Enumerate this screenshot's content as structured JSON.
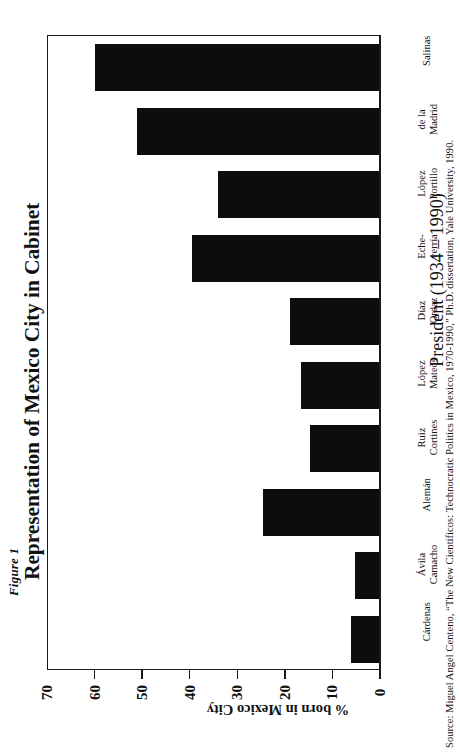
{
  "figure_label": "Figure 1",
  "title": "Representation of Mexico City in Cabinet",
  "value_axis_title": "% born in Mexico City",
  "category_axis_title": "President (1934 – 1990)",
  "source": "Source:  Miguel Angel Centeno, “The New Científicos: Technocratic Politics in Mexico, 1970-1990,”  Ph.D. dissertation, Yale University, 1990.",
  "bar_color": "#0d0d0d",
  "axis_color": "#1a1a1a",
  "background_color": "#ffffff",
  "chart_data": {
    "type": "bar",
    "orientation": "vertical-rotated",
    "title": "Representation of Mexico City in Cabinet",
    "xlabel": "President (1934 – 1990)",
    "ylabel": "% born in Mexico City",
    "ylim": [
      0,
      70
    ],
    "yticks": [
      0,
      10,
      20,
      30,
      40,
      50,
      60,
      70
    ],
    "ytick_labels": [
      "0",
      "10",
      "20",
      "30",
      "40",
      "50",
      "60",
      "70"
    ],
    "grid": false,
    "legend": false,
    "categories": [
      "Cárdenas",
      "Ávila Camacho",
      "Alemán",
      "Ruiz Cortines",
      "López Mateos",
      "Díaz Ordaz",
      "Eche-verría",
      "López Portillo",
      "de la Madrid",
      "Salinas"
    ],
    "category_lines": [
      [
        "Cárdenas"
      ],
      [
        "Ávila",
        "Camacho"
      ],
      [
        "Alemán"
      ],
      [
        "Ruiz",
        "Cortines"
      ],
      [
        "López",
        "Mateos"
      ],
      [
        "Díaz",
        "Ordaz"
      ],
      [
        "Eche-",
        "verría"
      ],
      [
        "López",
        "Portillo"
      ],
      [
        "de la",
        "Madrid"
      ],
      [
        "Salinas"
      ]
    ],
    "values": [
      6,
      5.3,
      24.5,
      14.7,
      16.6,
      19,
      39.5,
      34,
      51,
      60
    ]
  }
}
